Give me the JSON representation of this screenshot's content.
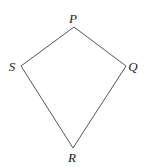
{
  "diagram": {
    "type": "quadrilateral (kite)",
    "stroke_color": "#555555",
    "vertices": [
      {
        "label": "P",
        "x": 74,
        "y": 27,
        "label_x": 73,
        "label_y": 23
      },
      {
        "label": "Q",
        "x": 126,
        "y": 66,
        "label_x": 133,
        "label_y": 71
      },
      {
        "label": "R",
        "x": 73,
        "y": 148,
        "label_x": 72,
        "label_y": 162
      },
      {
        "label": "S",
        "x": 21,
        "y": 66,
        "label_x": 12,
        "label_y": 71
      }
    ],
    "edges": [
      [
        "P",
        "Q"
      ],
      [
        "Q",
        "R"
      ],
      [
        "R",
        "S"
      ],
      [
        "S",
        "P"
      ]
    ]
  }
}
